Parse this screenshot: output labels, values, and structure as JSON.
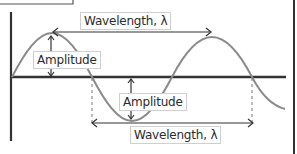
{
  "diagram": {
    "type": "transverse-wave",
    "labels": {
      "wavelength_top": "Wavelength, λ",
      "amplitude_crest": "Amplitude",
      "amplitude_trough": "Amplitude",
      "wavelength_bottom": "Wavelength, λ"
    },
    "colors": {
      "wave": "#8a8a8a",
      "axis": "#333333",
      "arrow": "#333333",
      "label_border": "#cfcfcf",
      "text": "#2b2b2b"
    }
  }
}
